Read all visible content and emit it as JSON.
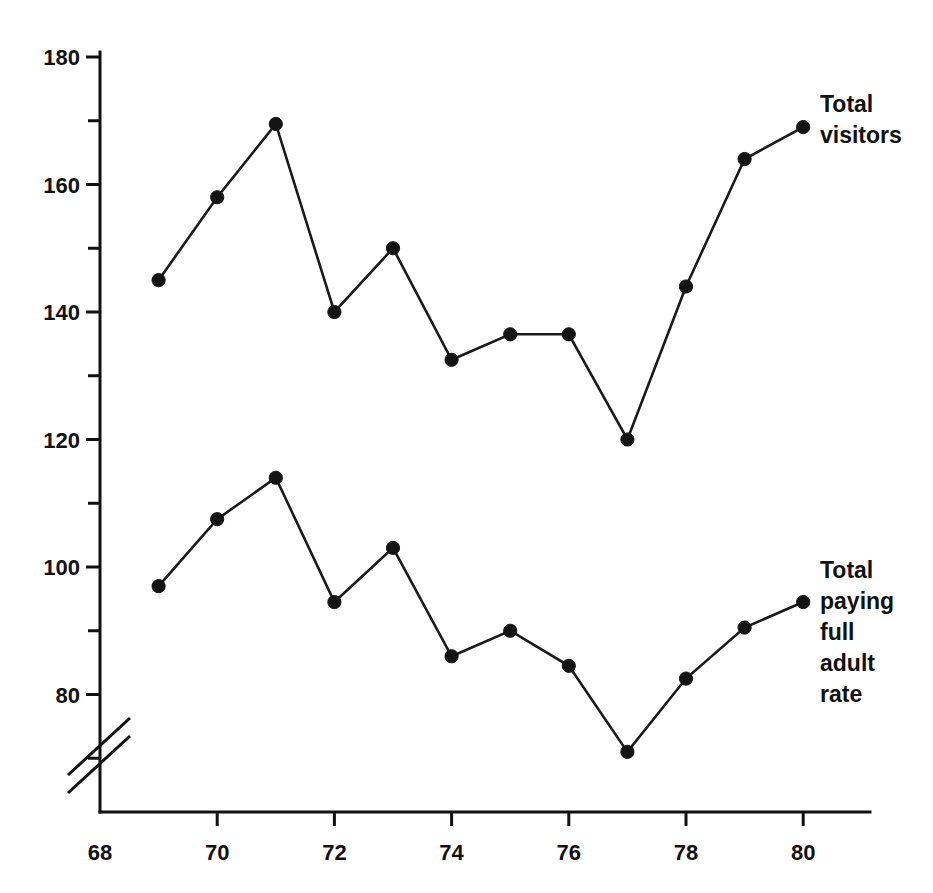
{
  "chart_data": {
    "type": "line",
    "title": "",
    "subtitle": "",
    "xlabel": "",
    "ylabel": "",
    "x": [
      69,
      70,
      71,
      72,
      73,
      74,
      75,
      76,
      77,
      78,
      79,
      80
    ],
    "xlim": [
      68,
      80
    ],
    "ylim": [
      70,
      180
    ],
    "grid": false,
    "legend_position": "right-inline",
    "axis_break": {
      "axis": "y",
      "present": true,
      "description": "double-slash break on the y-axis below the lowest tick"
    },
    "x_ticks": {
      "labels": [
        "68",
        "70",
        "72",
        "74",
        "76",
        "78",
        "80"
      ],
      "values": [
        68,
        70,
        72,
        74,
        76,
        78,
        80
      ]
    },
    "y_ticks": {
      "labels": [
        "180",
        "160",
        "140",
        "120",
        "100",
        "80"
      ],
      "values": [
        180,
        160,
        140,
        120,
        100,
        80
      ],
      "minor_values": [
        170,
        150,
        130,
        110,
        90,
        70
      ]
    },
    "series": [
      {
        "name": "Total visitors",
        "label_lines": [
          "Total",
          "visitors"
        ],
        "color": "#141414",
        "marker": "filled-circle",
        "values": [
          145,
          158,
          169.5,
          140,
          150,
          132.5,
          136.5,
          136.5,
          120,
          144,
          164,
          169
        ]
      },
      {
        "name": "Total paying full adult rate",
        "label_lines": [
          "Total",
          "paying",
          "full",
          "adult",
          "rate"
        ],
        "color": "#141414",
        "marker": "filled-circle",
        "values": [
          97,
          107.5,
          114,
          94.5,
          103,
          86,
          90,
          84.5,
          71,
          82.5,
          90.5,
          94.5
        ]
      }
    ]
  },
  "layout": {
    "plot_left": 98,
    "plot_right": 868,
    "plot_bottom": 812,
    "plot_top": 57,
    "x_pixel_per_unit": 58.6,
    "y_pixel_per_unit": 6.375,
    "x_origin_px": 100,
    "y_180_px": 57,
    "label_offsets": {
      "series_0_label_x": 820,
      "series_0_label_y": 112,
      "series_1_label_x": 820,
      "series_1_label_y": 578
    }
  }
}
